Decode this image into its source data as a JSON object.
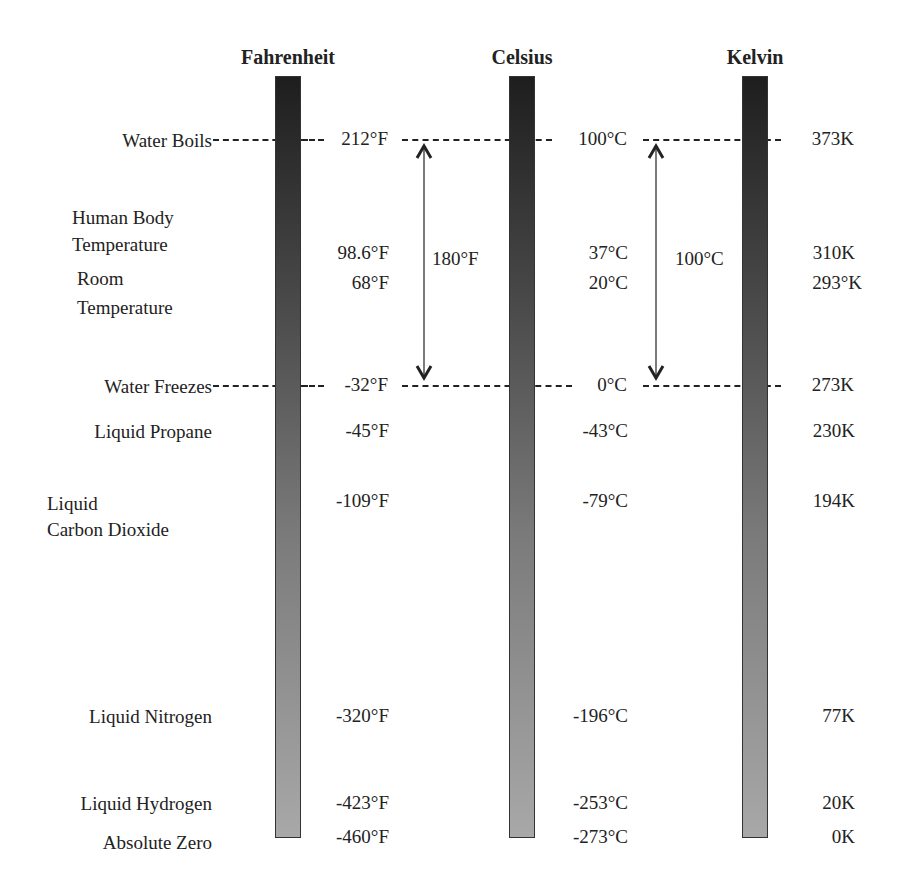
{
  "scales": {
    "fahrenheit": {
      "title": "Fahrenheit",
      "x": 288
    },
    "celsius": {
      "title": "Celsius",
      "x": 522
    },
    "kelvin": {
      "title": "Kelvin",
      "x": 755
    }
  },
  "rows": [
    {
      "label_lines": [
        "Water Boils"
      ],
      "f": "212°F",
      "c": "100°C",
      "k": "373K",
      "y": 140,
      "dashed": true
    },
    {
      "label_lines": [
        "Human Body",
        "Temperature"
      ],
      "f": "98.6°F",
      "c": "37°C",
      "k": "310K",
      "y": 255
    },
    {
      "label_lines": [
        "Room",
        "Temperature"
      ],
      "f": "68°F",
      "c": "20°C",
      "k": "293°K",
      "y": 296
    },
    {
      "label_lines": [
        "Water Freezes"
      ],
      "f": "-32°F",
      "c": "0°C",
      "k": "273K",
      "y": 386,
      "dashed": true
    },
    {
      "label_lines": [
        "Liquid Propane"
      ],
      "f": "-45°F",
      "c": "-43°C",
      "k": "230K",
      "y": 432
    },
    {
      "label_lines": [
        "Liquid",
        "Carbon Dioxide"
      ],
      "f": "-109°F",
      "c": "-79°C",
      "k": "194K",
      "y": 488
    },
    {
      "label_lines": [
        "Liquid Nitrogen"
      ],
      "f": "-320°F",
      "c": "-196°C",
      "k": "77K",
      "y": 717
    },
    {
      "label_lines": [
        "Liquid Hydrogen"
      ],
      "f": "-423°F",
      "c": "-253°C",
      "k": "20K",
      "y": 804
    },
    {
      "label_lines": [
        "Absolute Zero"
      ],
      "f": "-460°F",
      "c": "-273°C",
      "k": "0K",
      "y": 842
    }
  ],
  "labels": {
    "water_boils": "Water Boils",
    "human_body_1": "Human Body",
    "human_body_2": "Temperature",
    "room_1": "Room",
    "room_2": "Temperature",
    "water_freezes": "Water Freezes",
    "liquid_propane": "Liquid Propane",
    "liquid_co2_1": "Liquid",
    "liquid_co2_2": "Carbon Dioxide",
    "liquid_nitrogen": "Liquid Nitrogen",
    "liquid_hydrogen": "Liquid Hydrogen",
    "absolute_zero": "Absolute Zero"
  },
  "fahrenheit_values": [
    "212°F",
    "98.6°F",
    "68°F",
    "-32°F",
    "-45°F",
    "-109°F",
    "-320°F",
    "-423°F",
    "-460°F"
  ],
  "celsius_values": [
    "100°C",
    "37°C",
    "20°C",
    "0°C",
    "-43°C",
    "-79°C",
    "-196°C",
    "-253°C",
    "-273°C"
  ],
  "kelvin_values": [
    "373K",
    "310K",
    "293°K",
    "273K",
    "230K",
    "194K",
    "77K",
    "20K",
    "0K"
  ],
  "spans": {
    "fahrenheit_span": "180°F",
    "celsius_span": "100°C"
  },
  "colors": {
    "bar_top": "#1e1e1e",
    "bar_bottom": "#a8a8a8",
    "line": "#222222"
  }
}
